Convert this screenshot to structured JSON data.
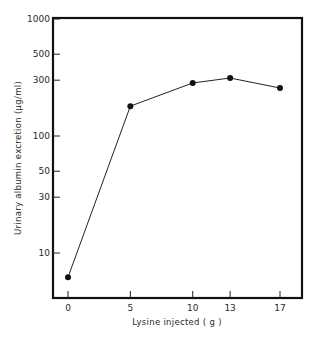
{
  "chart_data": {
    "type": "line",
    "title": "",
    "xlabel": "Lysine injected ( g )",
    "ylabel": "Urinary albumin excretion (μg/ml)",
    "x": [
      0,
      5,
      10,
      13,
      17
    ],
    "series": [
      {
        "name": "Urinary albumin excretion",
        "values": [
          6.2,
          180,
          284,
          313,
          257
        ]
      }
    ],
    "x_ticks": [
      "0",
      "5",
      "10",
      "13",
      "17"
    ],
    "y_ticks": [
      "1000",
      "500",
      "300",
      "100",
      "50",
      "30",
      "10"
    ],
    "y_scale": "log",
    "ylim": [
      4,
      1000
    ],
    "xlim": [
      -1,
      18.5
    ],
    "grid": false,
    "legend": "none",
    "marker": "filled-circle"
  }
}
